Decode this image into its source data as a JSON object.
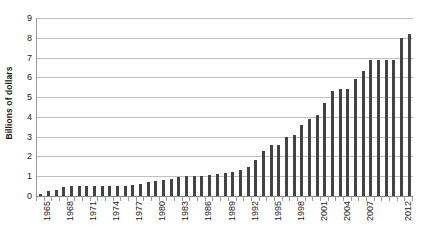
{
  "chart_data": {
    "type": "bar",
    "title": "",
    "subtitle": "",
    "xlabel": "",
    "ylabel": "Billions of dollars",
    "ylim": [
      0,
      9
    ],
    "ytick_labels": [
      "0",
      "1",
      "2",
      "3",
      "4",
      "5",
      "6",
      "7",
      "8",
      "9"
    ],
    "ytick_values": [
      0,
      1,
      2,
      3,
      4,
      5,
      6,
      7,
      8,
      9
    ],
    "grid": true,
    "legend": false,
    "legend_position": "none",
    "bar_color": "#434343",
    "gridline_color": "#bfbfbf",
    "axis_color": "#8a8a8a",
    "xtick_label_rotation": "-90",
    "xtick_label_interval": 3,
    "visible_xtick_labels": [
      "1965",
      "1968",
      "1971",
      "1974",
      "1977",
      "1980",
      "1983",
      "1986",
      "1989",
      "1992",
      "1995",
      "1998",
      "2001",
      "2004",
      "2007",
      "2012"
    ],
    "categories": [
      "1965",
      "1966",
      "1967",
      "1968",
      "1969",
      "1970",
      "1971",
      "1972",
      "1973",
      "1974",
      "1975",
      "1976",
      "1977",
      "1978",
      "1979",
      "1980",
      "1981",
      "1982",
      "1983",
      "1984",
      "1985",
      "1986",
      "1987",
      "1988",
      "1989",
      "1990",
      "1991",
      "1992",
      "1993",
      "1994",
      "1995",
      "1996",
      "1997",
      "1998",
      "1999",
      "2000",
      "2001",
      "2002",
      "2003",
      "2004",
      "2005",
      "2006",
      "2007",
      "2008",
      "2009",
      "2010",
      "2011",
      "2012",
      "2013"
    ],
    "values": [
      0.1,
      0.25,
      0.3,
      0.45,
      0.5,
      0.5,
      0.5,
      0.5,
      0.5,
      0.5,
      0.5,
      0.5,
      0.55,
      0.6,
      0.7,
      0.75,
      0.8,
      0.85,
      0.95,
      1.0,
      1.0,
      1.0,
      1.05,
      1.1,
      1.15,
      1.2,
      1.3,
      1.45,
      1.8,
      2.3,
      2.6,
      2.6,
      3.0,
      3.1,
      3.6,
      3.9,
      4.1,
      4.7,
      5.3,
      5.4,
      5.4,
      5.9,
      6.3,
      6.9,
      6.9,
      6.9,
      6.9,
      8.0,
      8.2
    ]
  }
}
